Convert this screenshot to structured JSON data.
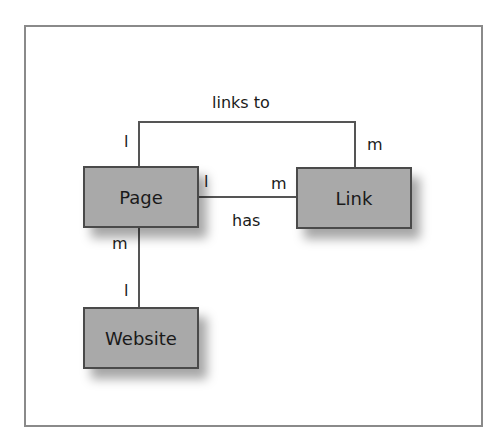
{
  "diagram": {
    "entities": {
      "page": "Page",
      "link": "Link",
      "website": "Website"
    },
    "relationships": {
      "links_to": {
        "label": "links to",
        "from_cardinality": "l",
        "to_cardinality": "m"
      },
      "has": {
        "label": "has",
        "from_cardinality": "l",
        "to_cardinality": "m"
      },
      "page_website": {
        "page_cardinality": "m",
        "website_cardinality": "l"
      }
    },
    "colors": {
      "entity_fill": "#a9a9a9",
      "entity_border": "#4a4a4a",
      "line": "#555555",
      "frame": "#8a8a8a"
    }
  }
}
